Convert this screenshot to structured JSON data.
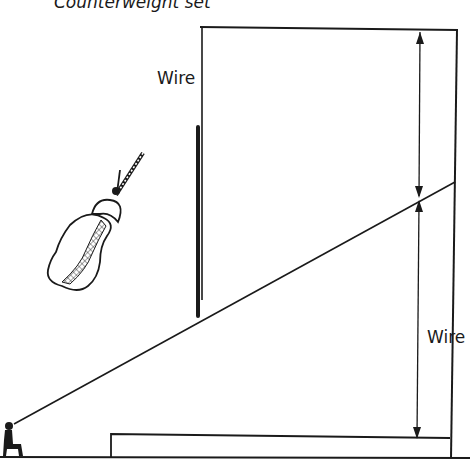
{
  "diagram": {
    "title": "Counterweight set",
    "labels": {
      "wire_top": "Wire",
      "wire_right": "Wire"
    },
    "colors": {
      "ink": "#1a1a1a",
      "background": "#ffffff"
    },
    "elements": [
      "seated-spectator",
      "sight-line",
      "stage-platform",
      "floor-line",
      "proscenium-wall",
      "fly-loft-wall",
      "grid-line",
      "batten-pipe",
      "sandbag-counterweight",
      "dimension-arrow-upper",
      "dimension-arrow-lower"
    ]
  }
}
